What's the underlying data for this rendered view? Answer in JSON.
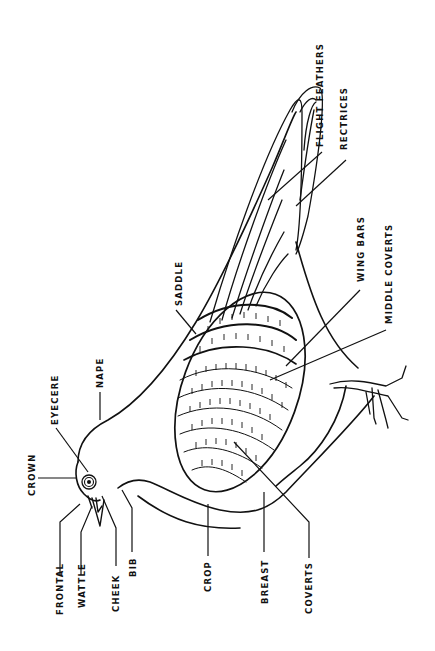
{
  "diagram": {
    "ink_color": "#111111",
    "background_color": "#ffffff",
    "labels": {
      "crown": "CROWN",
      "eyecere": "EYECERE",
      "nape": "NAPE",
      "saddle": "SADDLE",
      "flight_feathers": "FLIGHT FEATHERS",
      "rectrices": "RECTRICES",
      "wing_bars": "WING BARS",
      "middle_coverts": "MIDDLE COVERTS",
      "frontal": "FRONTAL",
      "wattle": "WATTLE",
      "cheek": "CHEEK",
      "bib": "BIB",
      "crop": "CROP",
      "breast": "BREAST",
      "coverts": "COVERTS"
    }
  }
}
